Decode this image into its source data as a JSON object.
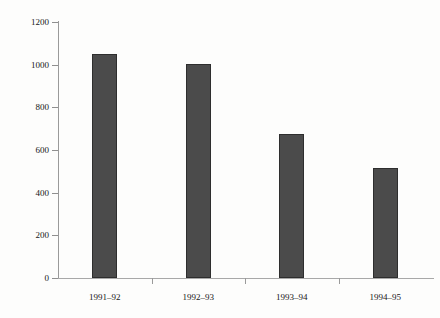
{
  "chart_data": {
    "type": "bar",
    "title": "",
    "subtitle": "",
    "xlabel": "",
    "ylabel": "£ million",
    "categories": [
      "1991–92",
      "1992–93",
      "1993–94",
      "1994–95"
    ],
    "values": [
      1050,
      1005,
      675,
      515
    ],
    "ylim": [
      0,
      1200
    ],
    "y_ticks": [
      0,
      200,
      400,
      600,
      800,
      1000,
      1200
    ],
    "y_tick_labels": [
      "0",
      "200",
      "400",
      "600",
      "800",
      "1000",
      "1200"
    ],
    "grid": false,
    "legend": "none",
    "bar_color": "#4b4b4b",
    "bar_edge_color": "#2e2e2e",
    "axis_color": "#9a9a9a",
    "background_color": "#fdfdfc"
  }
}
